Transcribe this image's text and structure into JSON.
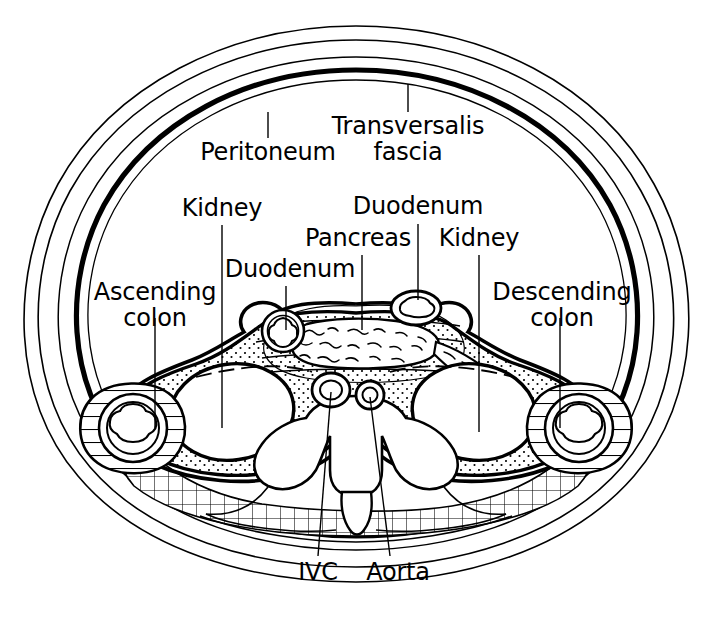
{
  "figure": {
    "type": "anatomical-cross-section",
    "region": "abdomen transverse section",
    "background_color": "#ffffff",
    "ink_color": "#000000"
  },
  "labels": [
    {
      "id": "peritoneum",
      "text": "Peritoneum",
      "lines": [
        "Peritoneum"
      ]
    },
    {
      "id": "transversalis",
      "text": "Transversalis fascia",
      "lines": [
        "Transversalis",
        "fascia"
      ]
    },
    {
      "id": "kidney_left",
      "text": "Kidney",
      "lines": [
        "Kidney"
      ]
    },
    {
      "id": "duodenum_upper",
      "text": "Duodenum",
      "lines": [
        "Duodenum"
      ]
    },
    {
      "id": "pancreas",
      "text": "Pancreas",
      "lines": [
        "Pancreas"
      ]
    },
    {
      "id": "kidney_right",
      "text": "Kidney",
      "lines": [
        "Kidney"
      ]
    },
    {
      "id": "duodenum_lower",
      "text": "Duodenum",
      "lines": [
        "Duodenum"
      ]
    },
    {
      "id": "ascending_colon",
      "text": "Ascending colon",
      "lines": [
        "Ascending",
        "colon"
      ]
    },
    {
      "id": "descending_colon",
      "text": "Descending colon",
      "lines": [
        "Descending",
        "colon"
      ]
    },
    {
      "id": "ivc",
      "text": "IVC",
      "lines": [
        "IVC"
      ]
    },
    {
      "id": "aorta",
      "text": "Aorta",
      "lines": [
        "Aorta"
      ]
    }
  ],
  "label_text": {
    "peritoneum": "Peritoneum",
    "transversalis_l1": "Transversalis",
    "transversalis_l2": "fascia",
    "kidney_left": "Kidney",
    "duodenum_upper": "Duodenum",
    "pancreas": "Pancreas",
    "kidney_right": "Kidney",
    "duodenum_lower": "Duodenum",
    "ascending_l1": "Ascending",
    "ascending_l2": "colon",
    "descending_l1": "Descending",
    "descending_l2": "colon",
    "ivc": "IVC",
    "aorta": "Aorta"
  },
  "structures": [
    {
      "id": "body-wall",
      "name": "body wall outline"
    },
    {
      "id": "peritoneum-line",
      "name": "peritoneum (thick line)"
    },
    {
      "id": "transversalis-line",
      "name": "transversalis fascia"
    },
    {
      "id": "ascending-colon",
      "name": "ascending colon"
    },
    {
      "id": "descending-colon",
      "name": "descending colon"
    },
    {
      "id": "kidney-left",
      "name": "kidney (left of image)"
    },
    {
      "id": "kidney-right",
      "name": "kidney (right of image)"
    },
    {
      "id": "pancreas",
      "name": "pancreas"
    },
    {
      "id": "duodenum-left",
      "name": "duodenum (left of image)"
    },
    {
      "id": "duodenum-right",
      "name": "duodenum (right of image)"
    },
    {
      "id": "ivc",
      "name": "inferior vena cava"
    },
    {
      "id": "aorta",
      "name": "aorta"
    },
    {
      "id": "vertebra",
      "name": "vertebral body and spinous process"
    },
    {
      "id": "perirenal-fat",
      "name": "perirenal fat (stippled)"
    },
    {
      "id": "muscle-hatch",
      "name": "posterior muscle (cross-hatched)"
    }
  ]
}
